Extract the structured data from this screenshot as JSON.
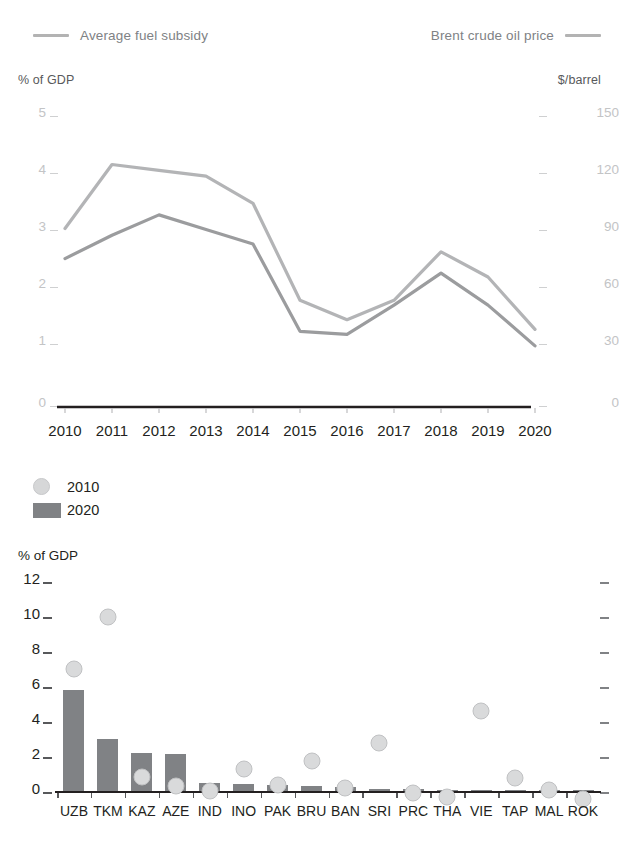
{
  "line_chart": {
    "legend": [
      {
        "label": "Average fuel subsidy",
        "marker": "line-swatch",
        "position": "left",
        "color": "#b3b3b3"
      },
      {
        "label": "Brent crude oil price",
        "marker": "line-swatch",
        "position": "right",
        "color": "#b3b3b3"
      }
    ],
    "left_axis_title": "% of GDP",
    "right_axis_title": "$/barrel",
    "left_ticks": [
      "5",
      "4",
      "3",
      "2",
      "1",
      "0"
    ],
    "right_ticks": [
      "150",
      "120",
      "90",
      "60",
      "30",
      "0"
    ],
    "x_ticks": [
      "2010",
      "2011",
      "2012",
      "2013",
      "2014",
      "2015",
      "2016",
      "2017",
      "2018",
      "2019",
      "2020"
    ]
  },
  "bar_chart": {
    "legend": [
      {
        "label": "2010",
        "marker": "circle",
        "color": "#d6d7d8"
      },
      {
        "label": "2020",
        "marker": "rect",
        "color": "#808285"
      }
    ],
    "y_axis_title": "% of GDP",
    "y_ticks": [
      "12",
      "10",
      "8",
      "6",
      "4",
      "2",
      "0"
    ],
    "x_ticks": [
      "UZB",
      "TKM",
      "KAZ",
      "AZE",
      "IND",
      "INO",
      "PAK",
      "BRU",
      "BAN",
      "SRI",
      "PRC",
      "THA",
      "VIE",
      "TAP",
      "MAL",
      "ROK"
    ]
  },
  "chart_data": [
    {
      "type": "line",
      "title": "",
      "xlabel": "",
      "ylabel": "% of GDP",
      "y2label": "$/barrel",
      "x": [
        2010,
        2011,
        2012,
        2013,
        2014,
        2015,
        2016,
        2017,
        2018,
        2019,
        2020
      ],
      "ylim": [
        0,
        5
      ],
      "y2lim": [
        0,
        150
      ],
      "grid": false,
      "legend_position": "top",
      "series": [
        {
          "name": "Average fuel subsidy",
          "axis": "left",
          "unit": "% of GDP",
          "color": "#9b9c9e",
          "values": [
            2.55,
            2.95,
            3.3,
            3.05,
            2.8,
            1.3,
            1.25,
            1.75,
            2.3,
            1.75,
            1.05
          ]
        },
        {
          "name": "Brent crude oil price",
          "axis": "right",
          "unit": "$/barrel",
          "color": "#b3b4b6",
          "values": [
            92,
            125,
            122,
            119,
            105,
            55,
            45,
            55,
            80,
            67,
            40
          ]
        }
      ]
    },
    {
      "type": "bar",
      "title": "",
      "xlabel": "",
      "ylabel": "% of GDP",
      "ylim": [
        0,
        12.8
      ],
      "grid": false,
      "legend_position": "top-left",
      "categories": [
        "UZB",
        "TKM",
        "KAZ",
        "AZE",
        "IND",
        "INO",
        "PAK",
        "BRU",
        "BAN",
        "SRI",
        "PRC",
        "THA",
        "VIE",
        "TAP",
        "MAL",
        "ROK"
      ],
      "series": [
        {
          "name": "2020",
          "marker": "bar",
          "color": "#808285",
          "values": [
            6.2,
            3.2,
            2.35,
            2.25,
            0.5,
            0.45,
            0.35,
            0.3,
            0.25,
            0.1,
            0.1,
            0.05,
            0.02,
            0.05,
            0.05,
            0.02
          ]
        },
        {
          "name": "2010",
          "marker": "circle",
          "color": "#d6d7d8",
          "values": [
            8.0,
            11.2,
            1.35,
            0.85,
            0.55,
            1.85,
            0.9,
            2.35,
            0.7,
            3.45,
            0.4,
            0.15,
            5.45,
            1.3,
            0.6,
            0.05
          ]
        }
      ]
    }
  ]
}
